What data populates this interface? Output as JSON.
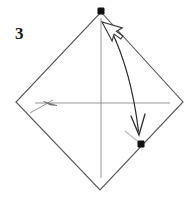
{
  "figure": {
    "step_label": "3",
    "caption": "",
    "background_color": "#ffffff"
  },
  "colors": {
    "outline": "#555555",
    "crease": "#8a8a8a",
    "faint_crease": "#b9b9b9",
    "marker": "#111111",
    "arrow": "#2b2b2b",
    "cursor_fill": "#ffffff",
    "cursor_stroke": "#3a3a3a",
    "label": "#1a1a1a"
  },
  "diagram": {
    "type": "origami-fold-step",
    "shape_name": "square-rotated-diamond",
    "vertices": {
      "top": {
        "x": 101,
        "y": 12
      },
      "right": {
        "x": 183,
        "y": 102
      },
      "bottom": {
        "x": 100,
        "y": 190
      },
      "left": {
        "x": 16,
        "y": 102
      }
    },
    "crease_horizontal": {
      "x1": 35,
      "y1": 103,
      "x2": 170,
      "y2": 103
    },
    "crease_vertical": {
      "x1": 101,
      "y1": 18,
      "x2": 101,
      "y2": 178
    },
    "crease_short_diagonal": {
      "x1": 30,
      "y1": 112,
      "x2": 52,
      "y2": 101
    },
    "crease_faint_short": {
      "x1": 125,
      "y1": 131,
      "x2": 141,
      "y2": 144
    },
    "markers": [
      {
        "name": "top-corner-marker",
        "x": 101,
        "y": 11,
        "size": 7,
        "shape": "square"
      },
      {
        "name": "target-corner-marker",
        "x": 141,
        "y": 144,
        "size": 7,
        "shape": "square"
      }
    ],
    "fold_arrow": {
      "label": "fold top corner down to right edge",
      "start": {
        "x": 112,
        "y": 30
      },
      "control": {
        "x": 128,
        "y": 72
      },
      "end": {
        "x": 138,
        "y": 134
      },
      "head": "open-v",
      "direction": "down-right"
    },
    "small_arrow": {
      "label": "crease direction",
      "from": {
        "x": 58,
        "y": 105
      },
      "to": {
        "x": 44,
        "y": 101
      },
      "direction": "left"
    },
    "cursor": {
      "name": "mouse-pointer",
      "tip": {
        "x": 102,
        "y": 22
      },
      "rotation_deg": -30,
      "width": 17,
      "height": 22
    }
  }
}
